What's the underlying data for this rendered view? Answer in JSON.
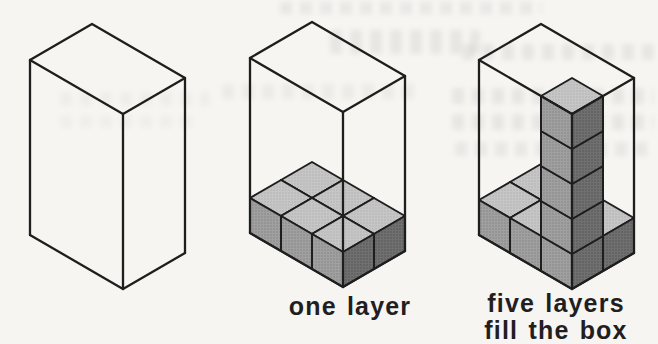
{
  "page": {
    "background_color": "#f6f5f2",
    "caption_color": "#221e1f"
  },
  "diagram": {
    "line_color": "#1e1e1e",
    "face_colors": {
      "top": "#c6c6c6",
      "top_dot": "#b0b0b0",
      "left": "#a0a0a0",
      "left_dot": "#828282",
      "right": "#707070",
      "right_dot": "#525252"
    },
    "unit": {
      "ux": 31,
      "uy": 18,
      "vx": -31,
      "vy": 18,
      "h": 35
    },
    "box": {
      "cols": 3,
      "rows": 2,
      "layers": 5
    },
    "figures": [
      {
        "name": "empty-box",
        "origin": [
          92,
          24
        ],
        "show_layer": false,
        "column": null,
        "caption_lines": []
      },
      {
        "name": "one-layer",
        "origin": [
          312,
          22
        ],
        "show_layer": true,
        "column": null,
        "caption_lines": [
          "one layer"
        ]
      },
      {
        "name": "five-layers",
        "origin": [
          541,
          24
        ],
        "show_layer": true,
        "column": {
          "cell": [
            2,
            1
          ],
          "height": 5
        },
        "caption_lines": [
          "five layers",
          "fill the box"
        ]
      }
    ]
  }
}
